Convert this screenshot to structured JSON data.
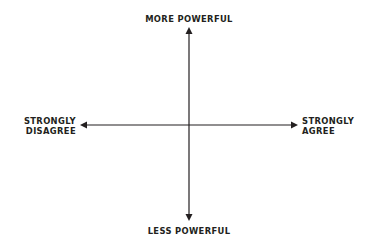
{
  "diagram": {
    "type": "quadrant-axes",
    "axes": {
      "vertical": {
        "top_label": "MORE POWERFUL",
        "bottom_label": "LESS POWERFUL"
      },
      "horizontal": {
        "left_label_lines": [
          "STRONGLY",
          "DISAGREE"
        ],
        "right_label_lines": [
          "STRONGLY",
          "AGREE"
        ]
      }
    },
    "colors": {
      "line": "#231f20",
      "text": "#231f20",
      "background": "#ffffff"
    }
  }
}
